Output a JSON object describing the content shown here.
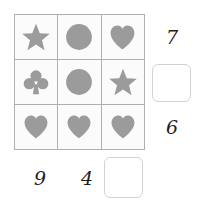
{
  "puzzle": {
    "type": "symbol-sum-grid",
    "shape_color": "#9b9b9b",
    "cell_background": "#fbfbfb",
    "grid_line_color": "#b0b0b0",
    "label_color": "#1d1d1d",
    "rows": [
      {
        "cells": [
          {
            "icon": "star-icon",
            "label": "star"
          },
          {
            "icon": "circle-icon",
            "label": "circle"
          },
          {
            "icon": "heart-icon",
            "label": "heart"
          }
        ],
        "sum_label": "7"
      },
      {
        "cells": [
          {
            "icon": "club-icon",
            "label": "club"
          },
          {
            "icon": "circle-icon",
            "label": "circle"
          },
          {
            "icon": "star-icon",
            "label": "star"
          }
        ],
        "sum_label": ""
      },
      {
        "cells": [
          {
            "icon": "heart-icon",
            "label": "heart"
          },
          {
            "icon": "heart-icon",
            "label": "heart"
          },
          {
            "icon": "heart-icon",
            "label": "heart"
          }
        ],
        "sum_label": "6"
      }
    ],
    "column_sums": [
      "9",
      "4",
      ""
    ],
    "answer_boxes": {
      "right": {
        "value": "",
        "placeholder": ""
      },
      "bottom": {
        "value": "",
        "placeholder": ""
      }
    }
  }
}
